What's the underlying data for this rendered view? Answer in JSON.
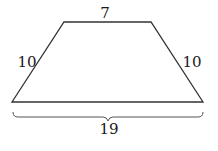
{
  "figure": {
    "shape": "isosceles-trapezoid",
    "labels": {
      "top": "7",
      "left": "10",
      "right": "10",
      "bottom": "19"
    },
    "colors": {
      "stroke": "#333333",
      "text": "#1a1a1a",
      "background": "#ffffff"
    }
  }
}
